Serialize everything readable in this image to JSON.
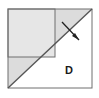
{
  "figure": {
    "kind": "geometry-diagram",
    "canvas": {
      "width": 99,
      "height": 98
    },
    "outer_square": {
      "name": "outer-square",
      "x": 8,
      "y": 9,
      "width": 84,
      "height": 79,
      "stroke": "#6e6e6e",
      "stroke_width": 1,
      "fill": "#ffffff"
    },
    "diagonal": {
      "name": "main-diagonal",
      "x1": 8,
      "y1": 88,
      "x2": 92,
      "y2": 9,
      "stroke": "#555555",
      "stroke_width": 1.4,
      "description": "diagonal from bottom-left corner to top-right corner"
    },
    "shaded_triangle": {
      "name": "upper-left-triangle",
      "points": "8,9 92,9 8,88",
      "fill": "#dcdcdc",
      "description": "upper-left half of the square, shaded light gray"
    },
    "white_triangle": {
      "name": "lower-right-triangle",
      "points": "92,9 92,88 8,88",
      "fill": "#ffffff",
      "description": "lower-right half of the square, unshaded"
    },
    "inner_square": {
      "name": "inner-square",
      "x": 8,
      "y": 9,
      "width": 47,
      "height": 48,
      "stroke": "#6e6e6e",
      "stroke_width": 1,
      "fill": "#e6e6e6",
      "description": "square in upper-left whose bottom-right corner meets the diagonal"
    },
    "arrow": {
      "name": "arrow-marker",
      "x1": 62,
      "y1": 22,
      "x2": 79,
      "y2": 40,
      "stroke": "#222222",
      "stroke_width": 1.3,
      "head_points": "79,40 72,36 75,33",
      "description": "short arrow crossing the diagonal pointing down-right"
    },
    "label_d": {
      "name": "label-d",
      "text": "D",
      "x": 69,
      "y": 74,
      "color": "#1a1a1a",
      "font_size": 11,
      "bold": true
    },
    "colors": {
      "shade_light": "#dcdcdc",
      "shade_inner": "#e6e6e6",
      "stroke": "#6e6e6e",
      "diagonal": "#555555",
      "ink": "#1a1a1a",
      "background": "#ffffff"
    }
  }
}
